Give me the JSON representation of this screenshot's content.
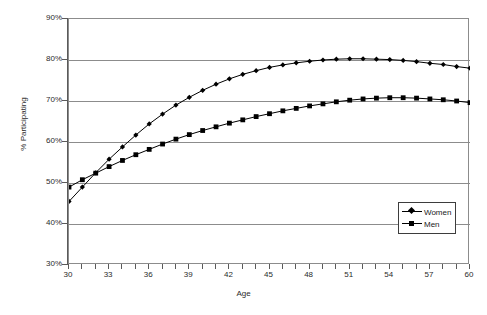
{
  "chart_data": {
    "type": "line",
    "title": "",
    "xlabel": "Age",
    "ylabel": "% Participating",
    "xlim": [
      30,
      60
    ],
    "ylim": [
      30,
      90
    ],
    "y_tick_labels": [
      "90%",
      "80%",
      "70%",
      "60%",
      "50%",
      "40%",
      "30%"
    ],
    "y_tick_values": [
      90,
      80,
      70,
      60,
      50,
      40,
      30
    ],
    "x_tick_labels": [
      "30",
      "33",
      "36",
      "39",
      "42",
      "45",
      "48",
      "51",
      "54",
      "57",
      "60"
    ],
    "x_tick_values": [
      30,
      33,
      36,
      39,
      42,
      45,
      48,
      51,
      54,
      57,
      60
    ],
    "x_minor_ticks": [
      30,
      31,
      32,
      33,
      34,
      35,
      36,
      37,
      38,
      39,
      40,
      41,
      42,
      43,
      44,
      45,
      46,
      47,
      48,
      49,
      50,
      51,
      52,
      53,
      54,
      55,
      56,
      57,
      58,
      59,
      60
    ],
    "grid": "horizontal",
    "legend_position": "lower-right",
    "x": [
      30,
      31,
      32,
      33,
      34,
      35,
      36,
      37,
      38,
      39,
      40,
      41,
      42,
      43,
      44,
      45,
      46,
      47,
      48,
      49,
      50,
      51,
      52,
      53,
      54,
      55,
      56,
      57,
      58,
      59,
      60
    ],
    "series": [
      {
        "name": "Women",
        "marker": "diamond",
        "color": "#000000",
        "values": [
          45.5,
          49.0,
          52.5,
          55.8,
          58.8,
          61.7,
          64.4,
          66.8,
          69.0,
          70.9,
          72.6,
          74.1,
          75.4,
          76.5,
          77.4,
          78.2,
          78.8,
          79.3,
          79.7,
          80.0,
          80.2,
          80.3,
          80.3,
          80.2,
          80.1,
          79.9,
          79.6,
          79.2,
          78.9,
          78.4,
          78.0
        ]
      },
      {
        "name": "Men",
        "marker": "square",
        "color": "#000000",
        "values": [
          49.0,
          50.8,
          52.4,
          54.0,
          55.5,
          56.9,
          58.2,
          59.5,
          60.7,
          61.8,
          62.8,
          63.7,
          64.6,
          65.4,
          66.2,
          66.9,
          67.6,
          68.2,
          68.8,
          69.3,
          69.8,
          70.2,
          70.5,
          70.7,
          70.8,
          70.8,
          70.7,
          70.5,
          70.3,
          70.0,
          69.6
        ]
      }
    ]
  },
  "axes": {
    "y_title": "% Participating",
    "x_title": "Age"
  },
  "legend": {
    "items": [
      {
        "label": "Women"
      },
      {
        "label": "Men"
      }
    ]
  }
}
